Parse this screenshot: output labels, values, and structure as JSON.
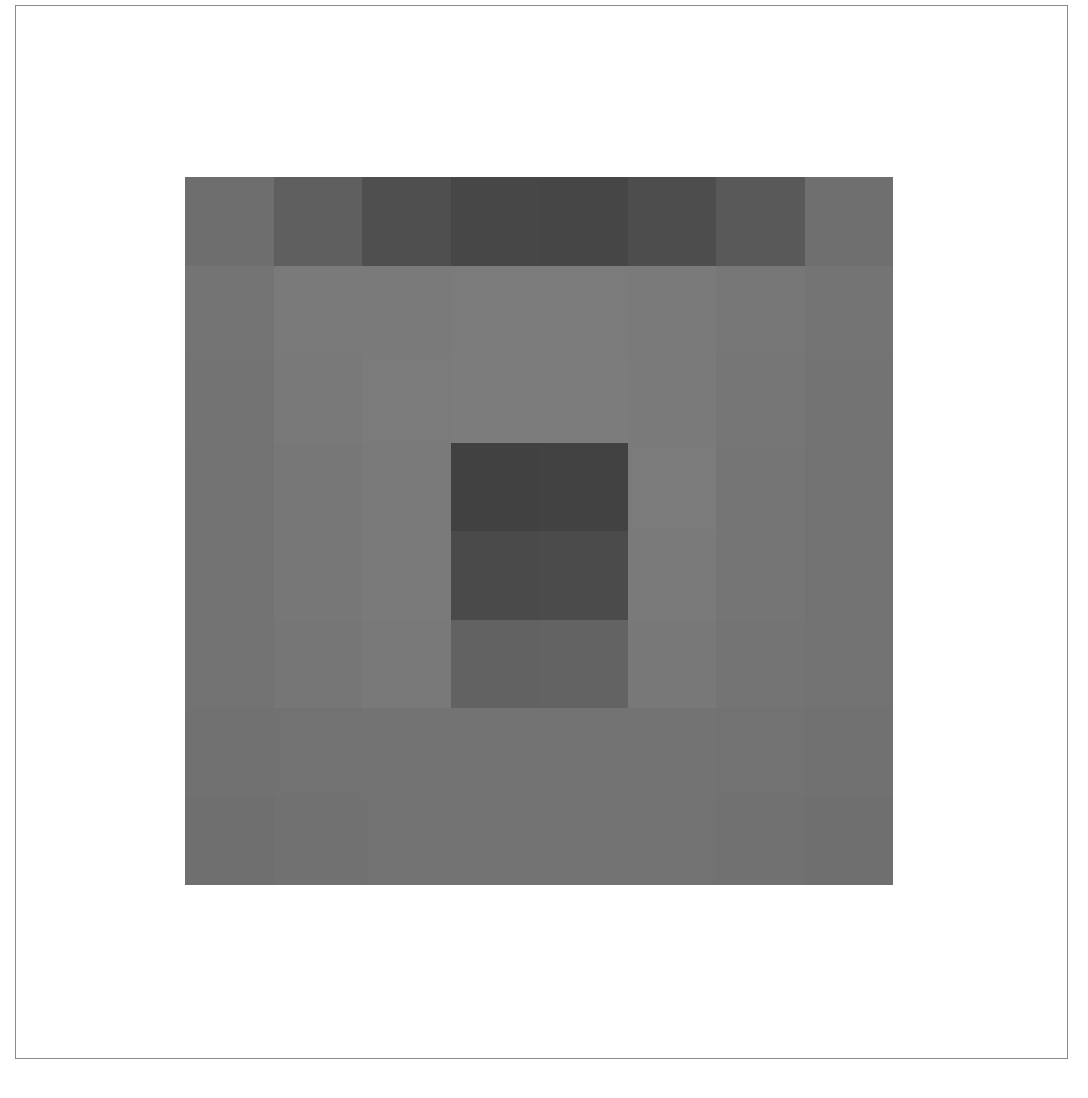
{
  "artwork": {
    "grid": {
      "columns": 8,
      "rows": 8
    },
    "cells": [
      [
        "#6e6e6e",
        "#5f5f5f",
        "#4f4f4f",
        "#474747",
        "#464646",
        "#4d4d4d",
        "#595959",
        "#6f6f6f"
      ],
      [
        "#747474",
        "#7a7a7a",
        "#7a7a7a",
        "#7b7b7b",
        "#7b7b7b",
        "#7a7a7a",
        "#777777",
        "#747474"
      ],
      [
        "#737373",
        "#797979",
        "#7b7b7b",
        "#7c7c7c",
        "#7c7c7c",
        "#7a7a7a",
        "#767676",
        "#737373"
      ],
      [
        "#727272",
        "#777777",
        "#7a7a7a",
        "#414141",
        "#424242",
        "#7b7b7b",
        "#757575",
        "#727272"
      ],
      [
        "#727272",
        "#777777",
        "#7a7a7a",
        "#4a4a4a",
        "#4b4b4b",
        "#7a7a7a",
        "#757575",
        "#727272"
      ],
      [
        "#727272",
        "#767676",
        "#797979",
        "#626262",
        "#636363",
        "#787878",
        "#747474",
        "#727272"
      ],
      [
        "#717171",
        "#727272",
        "#737373",
        "#737373",
        "#737373",
        "#737373",
        "#727272",
        "#717171"
      ],
      [
        "#6f6f6f",
        "#717171",
        "#727272",
        "#727272",
        "#727272",
        "#727272",
        "#717171",
        "#6f6f6f"
      ]
    ]
  }
}
